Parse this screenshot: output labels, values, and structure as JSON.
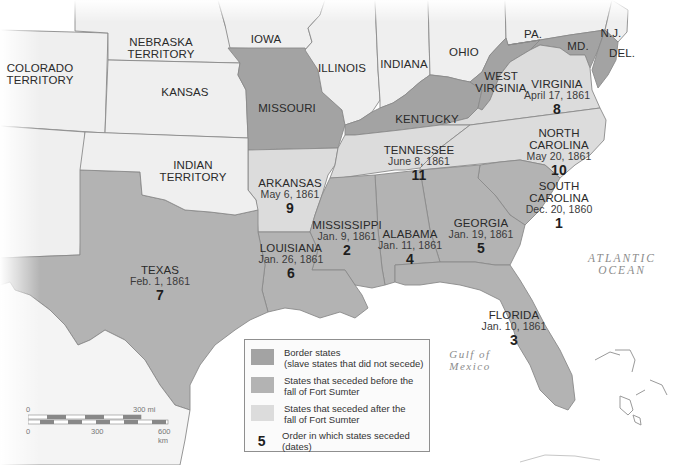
{
  "colors": {
    "border_states": "#a3a3a3",
    "seceded_before": "#b3b3b3",
    "seceded_after": "#dcdcdc",
    "other": "#efefef",
    "water": "#ffffff",
    "border_line": "#8a8a8a"
  },
  "territories": [
    {
      "name": "COLORADO TERRITORY",
      "line1": "COLORADO",
      "line2": "TERRITORY"
    },
    {
      "name": "NEBRASKA TERRITORY",
      "line1": "NEBRASKA",
      "line2": "TERRITORY"
    },
    {
      "name": "KANSAS",
      "line1": "KANSAS"
    },
    {
      "name": "INDIAN TERRITORY",
      "line1": "INDIAN",
      "line2": "TERRITORY"
    }
  ],
  "free_states": [
    {
      "name": "IOWA"
    },
    {
      "name": "ILLINOIS"
    },
    {
      "name": "INDIANA"
    },
    {
      "name": "OHIO"
    },
    {
      "name": "PA."
    },
    {
      "name": "N.J."
    }
  ],
  "border_states": [
    {
      "name": "MISSOURI"
    },
    {
      "name": "KENTUCKY"
    },
    {
      "name": "WEST VIRGINIA",
      "line1": "WEST",
      "line2": "VIRGINIA"
    },
    {
      "name": "MD."
    },
    {
      "name": "DEL."
    }
  ],
  "seceded_states": [
    {
      "name": "SOUTH CAROLINA",
      "line1": "SOUTH",
      "line2": "CAROLINA",
      "date": "Dec. 20, 1860",
      "order": "1",
      "group": "before"
    },
    {
      "name": "MISSISSIPPI",
      "date": "Jan. 9, 1861",
      "order": "2",
      "group": "before"
    },
    {
      "name": "FLORIDA",
      "date": "Jan. 10, 1861",
      "order": "3",
      "group": "before"
    },
    {
      "name": "ALABAMA",
      "date": "Jan. 11, 1861",
      "order": "4",
      "group": "before"
    },
    {
      "name": "GEORGIA",
      "date": "Jan. 19, 1861",
      "order": "5",
      "group": "before"
    },
    {
      "name": "LOUISIANA",
      "date": "Jan. 26, 1861",
      "order": "6",
      "group": "before"
    },
    {
      "name": "TEXAS",
      "date": "Feb. 1, 1861",
      "order": "7",
      "group": "before"
    },
    {
      "name": "VIRGINIA",
      "date": "April 17, 1861",
      "order": "8",
      "group": "after"
    },
    {
      "name": "ARKANSAS",
      "date": "May 6, 1861",
      "order": "9",
      "group": "after"
    },
    {
      "name": "NORTH CAROLINA",
      "line1": "NORTH",
      "line2": "CAROLINA",
      "date": "May 20, 1861",
      "order": "10",
      "group": "after"
    },
    {
      "name": "TENNESSEE",
      "date": "June 8, 1861",
      "order": "11",
      "group": "after"
    }
  ],
  "water_labels": {
    "atlantic": {
      "line1": "ATLANTIC",
      "line2": "OCEAN"
    },
    "gulf": {
      "line1": "Gulf of",
      "line2": "Mexico"
    }
  },
  "legend": {
    "items": [
      {
        "label_line1": "Border states",
        "label_line2": "(slave states that did not secede)",
        "swatch": "border_states"
      },
      {
        "label_line1": "States that seceded before the",
        "label_line2": "fall of Fort Sumter",
        "swatch": "seceded_before"
      },
      {
        "label_line1": "States that seceded after the",
        "label_line2": "fall of Fort Sumter",
        "swatch": "seceded_after"
      }
    ],
    "order_key": {
      "number": "5",
      "label": "Order in which states seceded (dates)"
    }
  },
  "scale_bar": {
    "mi_start": "0",
    "mi_end": "300 mi",
    "km_start": "0",
    "km_mid": "300",
    "km_end": "600 km"
  }
}
